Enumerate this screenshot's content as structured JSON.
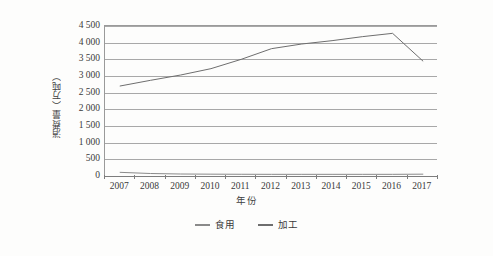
{
  "chart_data": {
    "type": "line",
    "title": "",
    "xlabel": "年份",
    "ylabel": "消费量（万吨）",
    "categories": [
      "2007",
      "2008",
      "2009",
      "2010",
      "2011",
      "2012",
      "2013",
      "2014",
      "2015",
      "2016",
      "2017"
    ],
    "ylim": [
      0,
      4500
    ],
    "ytick_labels": [
      "0",
      "500",
      "1 000",
      "1 500",
      "2 000",
      "2 500",
      "3 000",
      "3 500",
      "4 000",
      "4 500"
    ],
    "ytick_values": [
      0,
      500,
      1000,
      1500,
      2000,
      2500,
      3000,
      3500,
      4000,
      4500
    ],
    "grid": true,
    "legend_position": "bottom",
    "series": [
      {
        "name": "食用",
        "color": "#8a8a8a",
        "values": [
          110,
          75,
          60,
          55,
          52,
          50,
          50,
          50,
          50,
          50,
          55
        ]
      },
      {
        "name": "加工",
        "color": "#6e6e6e",
        "values": [
          2700,
          2870,
          3030,
          3220,
          3500,
          3820,
          3960,
          4060,
          4180,
          4280,
          3450
        ]
      }
    ]
  },
  "legend": {
    "items": [
      {
        "label": "食用"
      },
      {
        "label": "加工"
      }
    ]
  },
  "axes": {
    "x_title": "年份",
    "y_title": "消费量（万吨）"
  },
  "colors": {
    "grid": "#a8a8a8",
    "axis": "#7d7d7d",
    "text": "#3a3a3a",
    "series_edible": "#8a8a8a",
    "series_processing": "#6e6e6e",
    "background": "#fdfdfc"
  }
}
